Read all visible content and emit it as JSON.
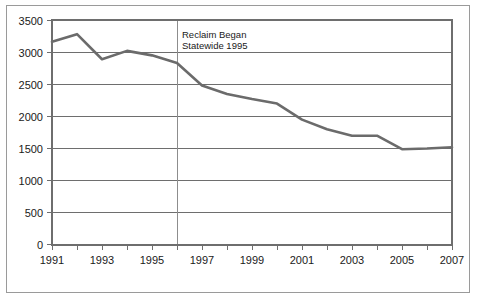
{
  "figure": {
    "background_color": "#ffffff",
    "frame_color": "#9a9a9a"
  },
  "chart_data": {
    "type": "line",
    "title": "",
    "subtitle": "",
    "xlabel": "",
    "ylabel": "",
    "grid": true,
    "legend": false,
    "legend_position": "none",
    "xlim": [
      1991,
      2007
    ],
    "ylim": [
      0,
      3500
    ],
    "ytick_values": [
      0,
      500,
      1000,
      1500,
      2000,
      2500,
      3000,
      3500
    ],
    "ytick_labels": [
      "0",
      "500",
      "1000",
      "1500",
      "2000",
      "2500",
      "3000",
      "3500"
    ],
    "xtick_values": [
      1991,
      1993,
      1995,
      1997,
      1999,
      2001,
      2003,
      2005,
      2007
    ],
    "xtick_labels": [
      "1991",
      "1993",
      "1995",
      "1997",
      "1999",
      "2001",
      "2003",
      "2005",
      "2007"
    ],
    "minor_xticks": [
      1992,
      1994,
      1996,
      1998,
      2000,
      2002,
      2004,
      2006
    ],
    "x": [
      1991,
      1992,
      1993,
      1994,
      1995,
      1996,
      1997,
      1998,
      1999,
      2000,
      2001,
      2002,
      2003,
      2004,
      2005,
      2006,
      2007
    ],
    "values": [
      3160,
      3280,
      2890,
      3020,
      2950,
      2830,
      2480,
      2350,
      2270,
      2200,
      1950,
      1800,
      1700,
      1700,
      1490,
      1500,
      1520
    ],
    "series": [
      {
        "name": "",
        "color": "#6b6b6b",
        "values": [
          3160,
          3280,
          2890,
          3020,
          2950,
          2830,
          2480,
          2350,
          2270,
          2200,
          1950,
          1800,
          1700,
          1700,
          1490,
          1500,
          1520
        ]
      }
    ],
    "annotations": [
      {
        "name": "reclaim-marker",
        "type": "vline",
        "x": 1996,
        "color": "#8d8d8d",
        "label_line_1": "Reclaim Began",
        "label_line_2": "Statewide 1995"
      }
    ]
  }
}
